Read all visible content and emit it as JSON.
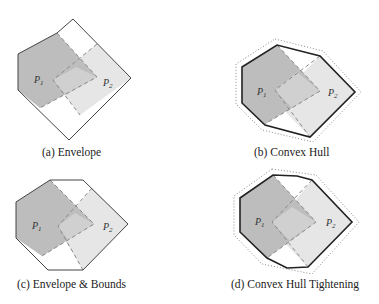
{
  "figure": {
    "panels": [
      {
        "id": "a",
        "caption": "(a) Envelope",
        "outline": "envelope",
        "outline_style": "thin",
        "dotted_hull": false
      },
      {
        "id": "b",
        "caption": "(b) Convex Hull",
        "outline": "convex-hull",
        "outline_style": "thick",
        "dotted_hull": true
      },
      {
        "id": "c",
        "caption": "(c) Envelope & Bounds",
        "outline": "envelope-bounds",
        "outline_style": "thin",
        "dotted_hull": false
      },
      {
        "id": "d",
        "caption": "(d) Convex Hull Tightening",
        "outline": "convex-hull-tightened",
        "outline_style": "thick",
        "dotted_hull": true
      }
    ],
    "labels": {
      "p1": "P",
      "p1_sub": "1",
      "p2": "P",
      "p2_sub": "2"
    },
    "colors": {
      "p1_fill": "#bdbdbd",
      "p2_fill": "#e6e6e6",
      "overlap_fill": "#d2d2d2",
      "outline": "#333333",
      "dashed": "#8a8a8a",
      "dotted": "#8a8a8a"
    }
  }
}
